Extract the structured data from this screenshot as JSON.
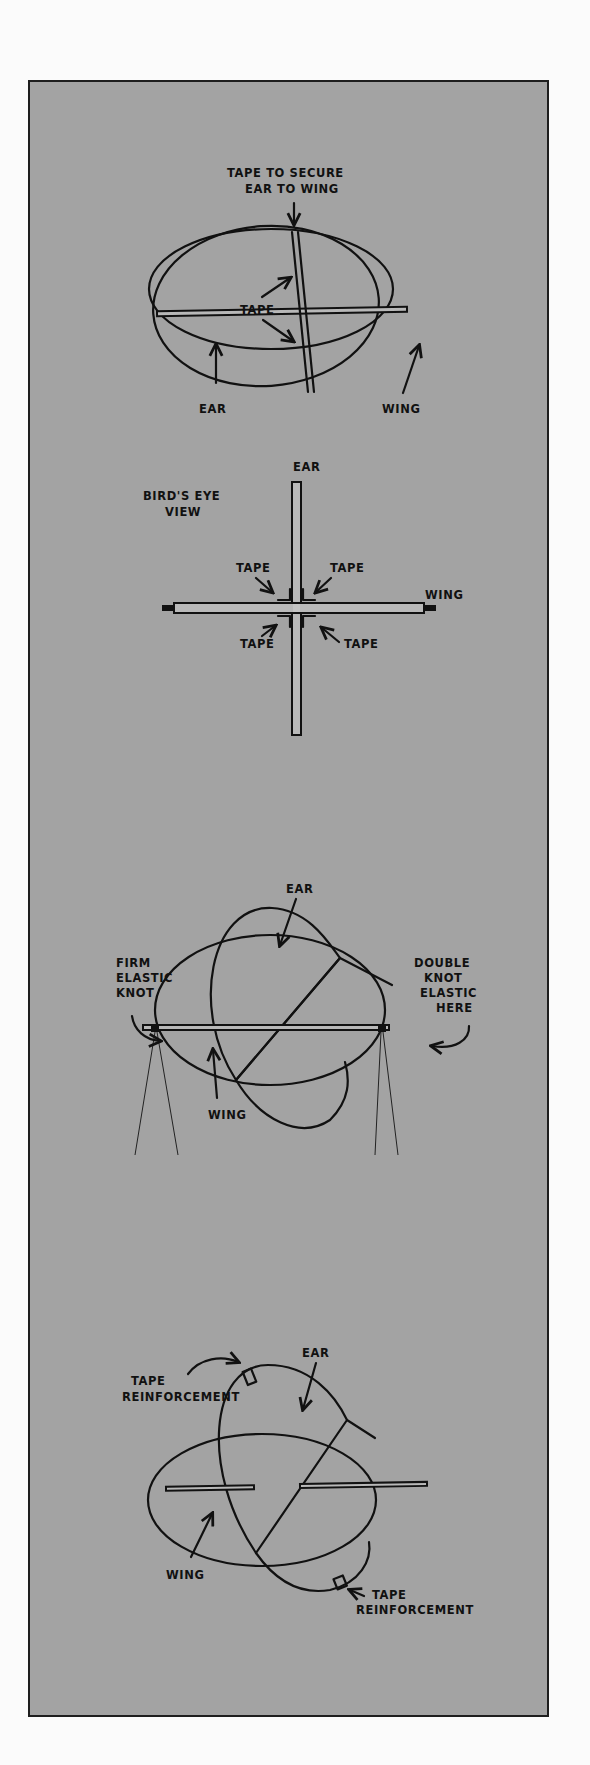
{
  "colors": {
    "page_background": "#fbfbfb",
    "panel_background": "#a3a3a3",
    "ink": "#111111"
  },
  "diagram1": {
    "title_line1": "TAPE TO SECURE",
    "title_line2": "EAR TO WING",
    "tape_label": "TAPE",
    "ear_label": "EAR",
    "wing_label": "WING"
  },
  "diagram2": {
    "view_line1": "BIRD'S EYE",
    "view_line2": "VIEW",
    "ear_label": "EAR",
    "wing_label": "WING",
    "tape_top_left": "TAPE",
    "tape_top_right": "TAPE",
    "tape_bottom_left": "TAPE",
    "tape_bottom_right": "TAPE"
  },
  "diagram3": {
    "ear_label": "EAR",
    "wing_label": "WING",
    "left_note_line1": "FIRM",
    "left_note_line2": "ELASTIC",
    "left_note_line3": "KNOT",
    "right_note_line1": "DOUBLE",
    "right_note_line2": "KNOT",
    "right_note_line3": "ELASTIC",
    "right_note_line4": "HERE"
  },
  "diagram4": {
    "ear_label": "EAR",
    "wing_label": "WING",
    "tape_top_line1": "TAPE",
    "tape_top_line2": "REINFORCEMENT",
    "tape_bottom_line1": "TAPE",
    "tape_bottom_line2": "REINFORCEMENT"
  }
}
